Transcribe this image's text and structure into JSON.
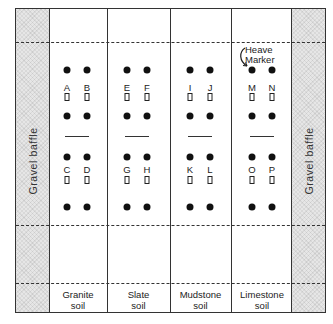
{
  "diagram": {
    "baffle_left_label": "Gravel baffle",
    "baffle_right_label": "Gravel baffle",
    "heave_marker_label_line1": "Heave",
    "heave_marker_label_line2": "Marker",
    "columns": [
      {
        "soil_line1": "Granite",
        "soil_line2": "soil",
        "plots": [
          "A",
          "B",
          "C",
          "D"
        ]
      },
      {
        "soil_line1": "Slate",
        "soil_line2": "soil",
        "plots": [
          "E",
          "F",
          "G",
          "H"
        ]
      },
      {
        "soil_line1": "Mudstone",
        "soil_line2": "soil",
        "plots": [
          "I",
          "J",
          "K",
          "L"
        ]
      },
      {
        "soil_line1": "Limestone",
        "soil_line2": "soil",
        "plots": [
          "M",
          "N",
          "O",
          "P"
        ]
      }
    ],
    "colors": {
      "line": "#333333",
      "baffle_fill": "#e6e6e6",
      "marker": "#111111"
    }
  }
}
